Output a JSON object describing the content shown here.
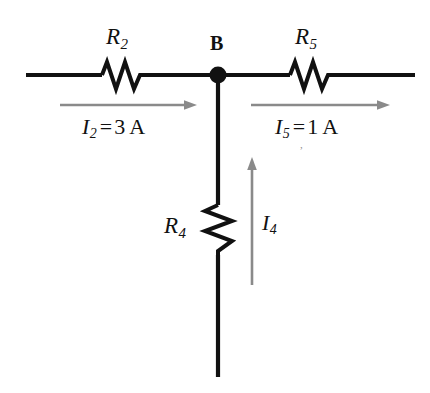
{
  "diagram": {
    "colors": {
      "wire": "#111111",
      "arrow": "#8a8a8a",
      "text": "#111111",
      "background": "#ffffff"
    },
    "node": {
      "label": "B",
      "name": "junction-node-b"
    },
    "resistors": [
      {
        "id": "r2",
        "symbol": "R",
        "subscript": "2",
        "orientation": "horizontal",
        "position": "left-branch"
      },
      {
        "id": "r5",
        "symbol": "R",
        "subscript": "5",
        "orientation": "horizontal",
        "position": "right-branch"
      },
      {
        "id": "r4",
        "symbol": "R",
        "subscript": "4",
        "orientation": "vertical",
        "position": "bottom-branch"
      }
    ],
    "currents": [
      {
        "id": "i2",
        "symbol": "I",
        "subscript": "2",
        "equals": "=",
        "value": "3",
        "unit": "A",
        "direction": "right",
        "branch": "left"
      },
      {
        "id": "i5",
        "symbol": "I",
        "subscript": "5",
        "equals": "=",
        "value": "1",
        "unit": "A",
        "direction": "right",
        "branch": "right"
      },
      {
        "id": "i4",
        "symbol": "I",
        "subscript": "4",
        "equals": "",
        "value": "",
        "unit": "",
        "direction": "up",
        "branch": "bottom"
      }
    ],
    "stray_mark": ","
  }
}
